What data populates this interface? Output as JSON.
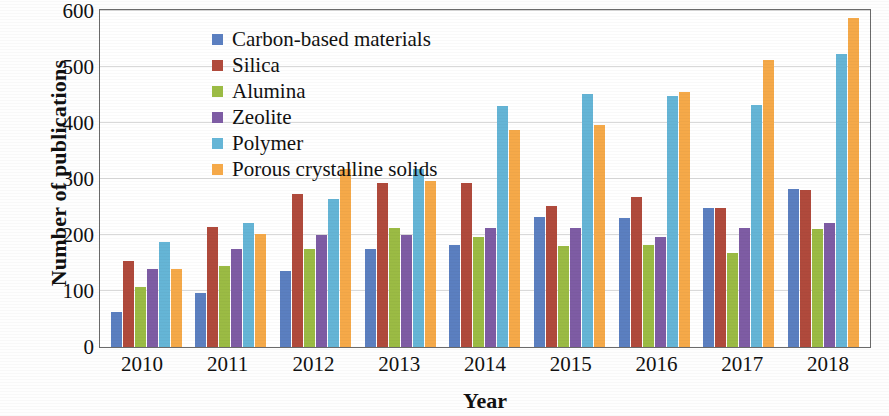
{
  "chart_data": {
    "type": "bar",
    "title": "",
    "xlabel": "Year",
    "ylabel": "Number of publications",
    "categories": [
      "2010",
      "2011",
      "2012",
      "2013",
      "2014",
      "2015",
      "2016",
      "2017",
      "2018"
    ],
    "ylim": [
      0,
      600
    ],
    "yticks": [
      0,
      100,
      200,
      300,
      400,
      500,
      600
    ],
    "ytick_labels": [
      "0",
      "100",
      "200",
      "300",
      "400",
      "500",
      "600"
    ],
    "grid": "horizontal",
    "legend_position": "upper-left-inside",
    "series": [
      {
        "name": "Carbon-based materials",
        "color": "#5B7FC0",
        "values": [
          62,
          97,
          136,
          175,
          182,
          233,
          231,
          249,
          283
        ]
      },
      {
        "name": "Silica",
        "color": "#B04A3C",
        "values": [
          154,
          214,
          273,
          292,
          292,
          252,
          268,
          249,
          281
        ]
      },
      {
        "name": "Alumina",
        "color": "#9BBB44",
        "values": [
          108,
          144,
          175,
          212,
          196,
          180,
          183,
          167,
          211
        ]
      },
      {
        "name": "Zeolite",
        "color": "#7E5CA4",
        "values": [
          140,
          175,
          200,
          200,
          212,
          212,
          196,
          212,
          221
        ]
      },
      {
        "name": "Polymer",
        "color": "#65B5D6",
        "values": [
          188,
          221,
          265,
          318,
          430,
          452,
          448,
          433,
          524
        ]
      },
      {
        "name": "Porous crystalline solids",
        "color": "#F5A949",
        "values": [
          140,
          202,
          318,
          297,
          387,
          397,
          455,
          512,
          588
        ]
      }
    ]
  },
  "axes": {
    "y_title": "Number of publications",
    "x_title": "Year"
  }
}
